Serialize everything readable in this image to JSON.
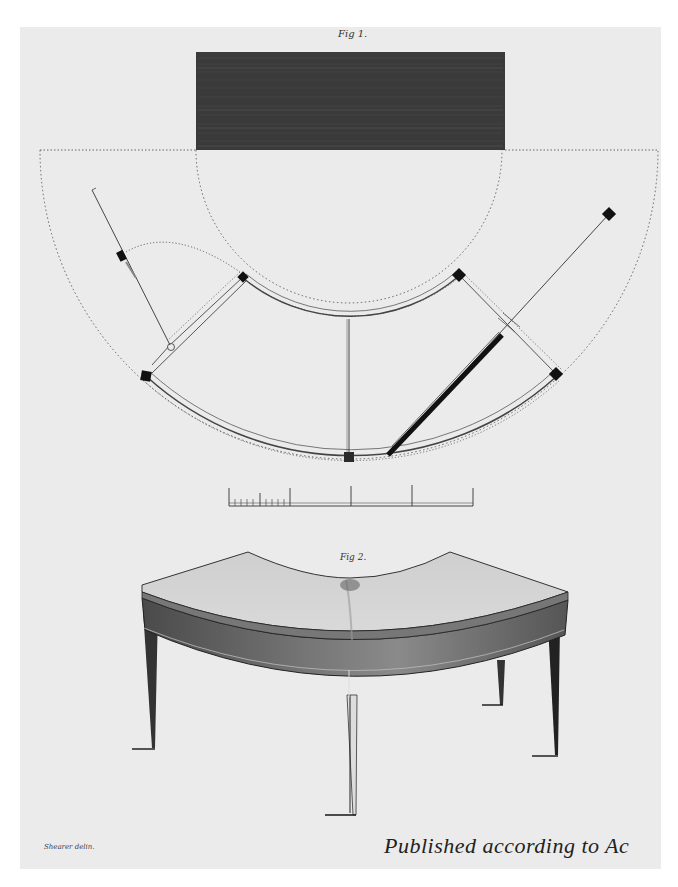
{
  "plate": {
    "figure1": {
      "label": "Fig 1.",
      "description": "Plan view of a quadrant-shaped (segmental) library/writing table with fly rails and hinged brackets"
    },
    "figure2": {
      "label": "Fig 2.",
      "description": "Perspective elevation of a concave segmental table on four tapered legs"
    },
    "scale_bar": {
      "major_ticks": 5,
      "minor_ticks_in_first_segment": 10
    },
    "credit_left": "Shearer delin.",
    "imprint": "Published according to Ac"
  },
  "colors": {
    "paper": "#ebebeb",
    "ink": "#222222",
    "background": "#ffffff"
  }
}
